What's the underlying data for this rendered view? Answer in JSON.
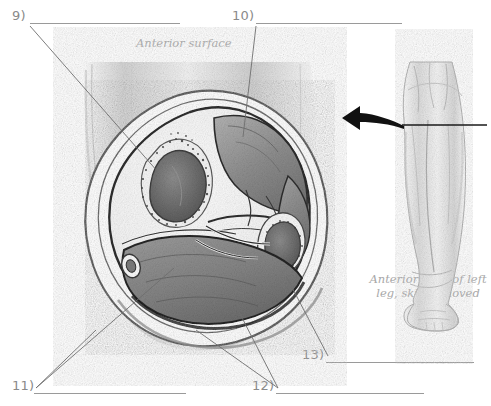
{
  "page": {
    "background": "#ffffff",
    "ink": "#8a8a8a",
    "line_color": "#9a9a9a",
    "caption_color": "#a8a8a8",
    "drawing_style": "pencil-shaded-anatomical"
  },
  "labels": [
    {
      "id": "9",
      "text": "9)",
      "answer": ""
    },
    {
      "id": "10",
      "text": "10)",
      "answer": ""
    },
    {
      "id": "11",
      "text": "11)",
      "answer": ""
    },
    {
      "id": "12",
      "text": "12)",
      "answer": ""
    },
    {
      "id": "13",
      "text": "13)",
      "answer": ""
    }
  ],
  "captions": {
    "anterior_surface": "Anterior surface",
    "leg_view_line1": "Anterior view of left",
    "leg_view_line2": "leg, skin removed"
  },
  "figure": {
    "main": "cross-section-of-leg",
    "inset": "anterior-view-left-leg",
    "arrow": "curved-arrow-left",
    "section_line": "transverse-section-level"
  }
}
